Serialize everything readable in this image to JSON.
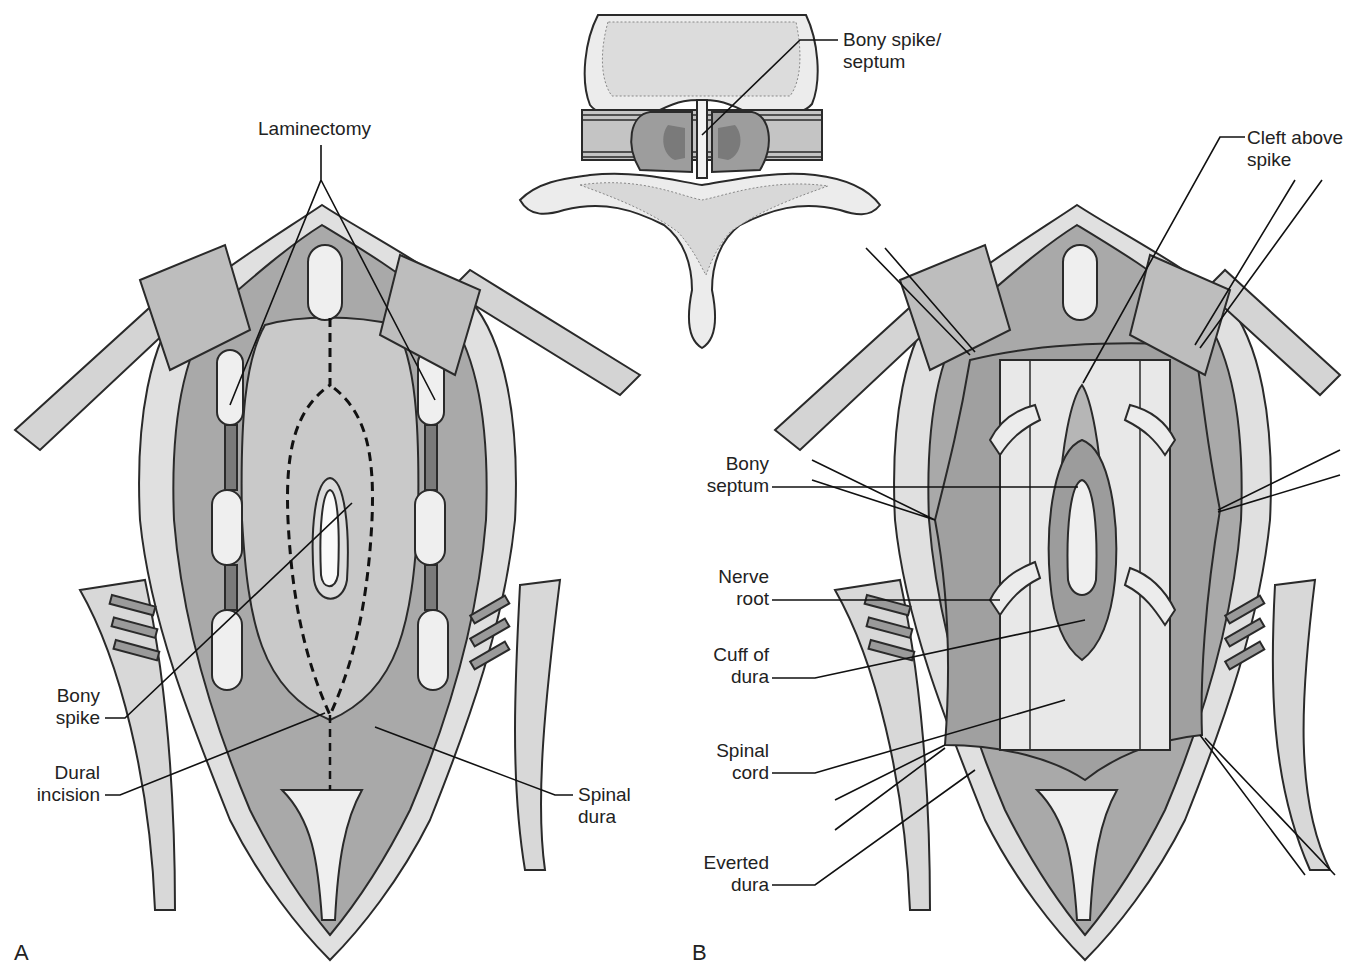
{
  "figure": {
    "panels": [
      {
        "id": "A",
        "label": "A"
      },
      {
        "id": "B",
        "label": "B"
      }
    ],
    "inset": {
      "description": "axial cross-section of vertebra with midline bony septum splitting spinal canal",
      "labels": {
        "bony_spike_septum": "Bony spike/\nseptum"
      }
    },
    "panel_a": {
      "labels": {
        "laminectomy": "Laminectomy",
        "bony_spike": "Bony\nspike",
        "dural_incision": "Dural\nincision",
        "spinal_dura": "Spinal\ndura"
      }
    },
    "panel_b": {
      "labels": {
        "cleft_above_spike": "Cleft above\nspike",
        "bony_septum": "Bony\nseptum",
        "nerve_root": "Nerve\nroot",
        "cuff_of_dura": "Cuff of\ndura",
        "spinal_cord": "Spinal\ncord",
        "everted_dura": "Everted\ndura"
      }
    },
    "colors": {
      "outline": "#2a2a2a",
      "muscle": "#a9a9a9",
      "dura": "#c8c8c8",
      "bone": "#ededed",
      "fat": "#e2e2e2",
      "cord": "#e6e6e6",
      "background": "#ffffff"
    }
  }
}
